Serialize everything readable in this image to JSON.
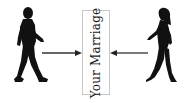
{
  "diagram": {
    "center_box": {
      "label": "Your Marriage",
      "border_color": "#c8c8c8"
    },
    "left_figure": {
      "icon": "walking-man-icon",
      "direction": "right"
    },
    "right_figure": {
      "icon": "walking-woman-icon",
      "direction": "left"
    },
    "arrows": [
      {
        "from": "left_figure",
        "to": "center_box"
      },
      {
        "from": "right_figure",
        "to": "center_box"
      }
    ],
    "colors": {
      "figure": "#111111",
      "arrow": "#333333",
      "background": "#ffffff"
    }
  }
}
